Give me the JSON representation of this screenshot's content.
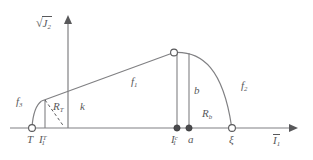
{
  "figure": {
    "type": "yield-surface-meridian-diagram",
    "background_color": "#ffffff",
    "line_color": "#808083",
    "label_color": "#58585a",
    "axes": {
      "y_axis": {
        "name": "sqrt-J2-axis",
        "label_radical": "√",
        "label_base": "J",
        "label_sub": "2",
        "x": 68,
        "y_top": 17,
        "y_bottom": 128
      },
      "x_axis": {
        "name": "I1-bar-axis",
        "label_base": "I",
        "label_sub": "1",
        "overbar": true,
        "y": 128,
        "x_left": 10,
        "x_right": 297
      }
    },
    "curve_labels": [
      {
        "id": "f3",
        "base": "f",
        "sub": "3",
        "x": 16,
        "y": 98
      },
      {
        "id": "f1",
        "base": "f",
        "sub": "1",
        "x": 131,
        "y": 78
      },
      {
        "id": "f2",
        "base": "f",
        "sub": "2",
        "x": 241,
        "y": 82
      }
    ],
    "segment_labels": [
      {
        "id": "RT",
        "base": "R",
        "sub": "T",
        "x": 53,
        "y": 104
      },
      {
        "id": "k",
        "base": "k",
        "sub": "",
        "x": 80,
        "y": 104
      },
      {
        "id": "b",
        "base": "b",
        "sub": "",
        "x": 188,
        "y": 88
      },
      {
        "id": "Rb",
        "base": "R",
        "sub": "b",
        "x": 202,
        "y": 110
      }
    ],
    "axis_point_labels": [
      {
        "id": "T",
        "base": "T",
        "sub": "",
        "sup": "",
        "x": 27,
        "y": 136
      },
      {
        "id": "I1T",
        "base": "I",
        "sub": "1",
        "sup": "T",
        "x": 38,
        "y": 136
      },
      {
        "id": "I1c",
        "base": "I",
        "sub": "1",
        "sup": "c",
        "x": 170,
        "y": 136
      },
      {
        "id": "a",
        "base": "a",
        "sub": "",
        "sup": "",
        "x": 187,
        "y": 136
      },
      {
        "id": "zeta",
        "base": "ξ",
        "sub": "",
        "sup": "",
        "x": 229,
        "y": 136
      }
    ],
    "markers": [
      {
        "id": "marker-T",
        "kind": "open-circle",
        "x": 32,
        "y": 128
      },
      {
        "id": "marker-peak",
        "kind": "open-circle",
        "x": 174,
        "y": 52
      },
      {
        "id": "marker-I1c",
        "kind": "filled-dot",
        "x": 177,
        "y": 128
      },
      {
        "id": "marker-a",
        "kind": "filled-dot",
        "x": 189,
        "y": 128
      },
      {
        "id": "marker-zeta",
        "kind": "open-circle",
        "x": 232,
        "y": 128
      }
    ],
    "vertical_lines": [
      {
        "id": "vline-I1T",
        "x": 45,
        "y_top": 100,
        "y_bottom": 128
      },
      {
        "id": "vline-I1c",
        "x": 177,
        "y_top": 53,
        "y_bottom": 128
      },
      {
        "id": "vline-a",
        "x": 189,
        "y_top": 53,
        "y_bottom": 128
      }
    ],
    "dashed_line": {
      "id": "RT-dashed",
      "x1": 45,
      "y1": 100,
      "x2": 63,
      "y2": 126
    },
    "straight_line": {
      "id": "f1-line",
      "x1": 41,
      "y1": 101,
      "x2": 174,
      "y2": 52
    },
    "left_curve": {
      "id": "f3-curve",
      "path": "M 32 127 C 33 113 36 105 41 101"
    },
    "right_curve": {
      "id": "f2-curve",
      "path": "M 174 52 C 205 52 224 72 232 127"
    }
  }
}
